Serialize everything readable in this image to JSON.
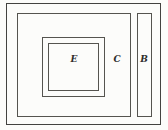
{
  "diagram": {
    "labels": {
      "e": "E",
      "c": "C",
      "b": "B"
    },
    "colors": {
      "background": "#fcfcfa",
      "line": "#55544f",
      "outer_line": "#434240",
      "text": "#2e2d2a"
    }
  }
}
